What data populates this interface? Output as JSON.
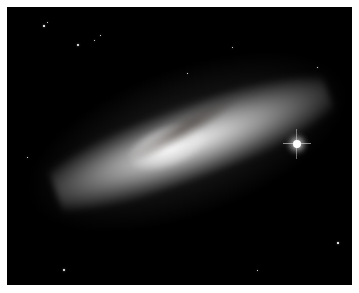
{
  "image": {
    "subject": "Edge-on starburst galaxy with dust lanes against a black star field",
    "background_color": "#000000",
    "border_color": "#ffffff"
  },
  "stars": [
    {
      "x": 36,
      "y": 18,
      "size": 1.5
    },
    {
      "x": 70,
      "y": 37,
      "size": 2
    },
    {
      "x": 87,
      "y": 33,
      "size": 1
    },
    {
      "x": 93,
      "y": 28,
      "size": 1
    },
    {
      "x": 40,
      "y": 15,
      "size": 1
    },
    {
      "x": 56,
      "y": 262,
      "size": 2
    },
    {
      "x": 330,
      "y": 235,
      "size": 1.5
    },
    {
      "x": 225,
      "y": 40,
      "size": 1
    },
    {
      "x": 180,
      "y": 66,
      "size": 1
    },
    {
      "x": 20,
      "y": 150,
      "size": 1
    },
    {
      "x": 310,
      "y": 60,
      "size": 1
    },
    {
      "x": 250,
      "y": 263,
      "size": 1
    }
  ]
}
